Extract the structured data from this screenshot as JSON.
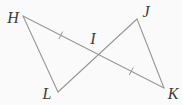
{
  "diagram": {
    "background": "#fafafa",
    "line_color": "#979797",
    "label_color": "#3c3c3c",
    "tick_length": 8.5,
    "points": {
      "H": {
        "label": "H",
        "x": 23,
        "y": 16,
        "label_x": 13,
        "label_y": 18
      },
      "J": {
        "label": "J",
        "x": 137,
        "y": 19,
        "label_x": 146,
        "label_y": 12
      },
      "I": {
        "label": "I",
        "x": 98.5,
        "y": 54.6,
        "label_x": 93,
        "label_y": 39
      },
      "L": {
        "label": "L",
        "x": 58,
        "y": 92,
        "label_x": 47,
        "label_y": 94
      },
      "K": {
        "label": "K",
        "x": 164,
        "y": 88,
        "label_x": 173,
        "label_y": 94
      }
    },
    "segments": [
      {
        "from": "H",
        "to": "K"
      },
      {
        "from": "L",
        "to": "J"
      },
      {
        "from": "H",
        "to": "L"
      },
      {
        "from": "J",
        "to": "K"
      }
    ],
    "tick_marks": [
      {
        "on": [
          "H",
          "I"
        ],
        "count": 1
      },
      {
        "on": [
          "I",
          "K"
        ],
        "count": 1
      }
    ]
  }
}
